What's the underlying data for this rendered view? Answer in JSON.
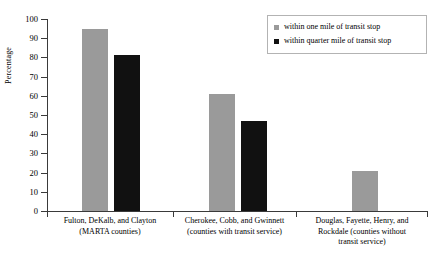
{
  "chart_data": {
    "type": "bar",
    "title": "",
    "xlabel": "",
    "ylabel": "Percentage",
    "ylim": [
      0,
      100
    ],
    "ytick_step": 10,
    "yticks": [
      100,
      90,
      80,
      70,
      60,
      50,
      40,
      30,
      20,
      10,
      0
    ],
    "grid": false,
    "legend_position": "top-right",
    "categories": [
      "Fulton, DeKalb, and Clayton (MARTA counties)",
      "Cherokee, Cobb, and Gwinnett (counties with transit service)",
      "Douglas, Fayette, Henry, and Rockdale (counties without transit service)"
    ],
    "category_lines": [
      [
        "Fulton, DeKalb, and Clayton",
        "(MARTA counties)"
      ],
      [
        "Cherokee, Cobb, and Gwinnett",
        "(counties with transit service)"
      ],
      [
        "Douglas, Fayette, Henry, and",
        "Rockdale (counties without",
        "transit service)"
      ]
    ],
    "series": [
      {
        "name": "within one mile of transit stop",
        "color": "#9a9a9a",
        "values": [
          95,
          61,
          21
        ]
      },
      {
        "name": "within quarter mile of transit stop",
        "color": "#111111",
        "values": [
          81,
          47,
          null
        ]
      }
    ]
  },
  "legend": {
    "items": [
      {
        "label": "within one mile of transit stop",
        "swatch": "light"
      },
      {
        "label": "within quarter mile of transit stop",
        "swatch": "dark"
      }
    ]
  },
  "axis": {
    "y_title": "Percentage"
  }
}
